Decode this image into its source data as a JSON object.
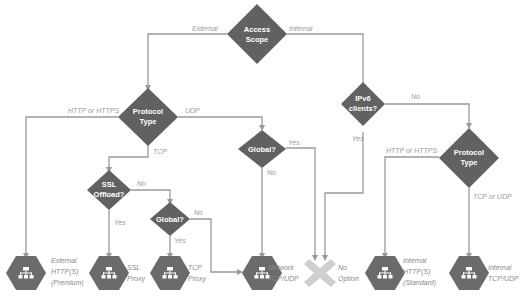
{
  "diagram": {
    "type": "decision-tree",
    "colors": {
      "decision_fill": "#616161",
      "leaf_fill": "#6b6b6b",
      "line": "#9a9a9a",
      "edge_label": "#9a9a9a",
      "no_option_fill": "#cfcfcf"
    },
    "decisions": {
      "access_scope": {
        "line1": "Access",
        "line2": "Scope"
      },
      "protocol_type_ext": {
        "line1": "Protocol",
        "line2": "Type"
      },
      "global_udp": {
        "line1": "Global?"
      },
      "ssl_offload": {
        "line1": "SSL",
        "line2": "Offload?"
      },
      "global_tcp": {
        "line1": "Global?"
      },
      "ipv6_clients": {
        "line1": "IPv6",
        "line2": "clients?"
      },
      "protocol_type_int": {
        "line1": "Protocol",
        "line2": "Type"
      }
    },
    "edges": {
      "external": "External",
      "internal": "Internal",
      "http_https_ext": "HTTP or HTTPS",
      "udp": "UDP",
      "tcp": "TCP",
      "global_udp_yes": "Yes",
      "global_udp_no": "No",
      "ssl_no": "No",
      "ssl_yes": "Yes",
      "global_tcp_no": "No",
      "global_tcp_yes": "Yes",
      "ipv6_yes": "Yes",
      "ipv6_no": "No",
      "http_https_int": "HTTP or HTTPS",
      "tcp_or_udp": "TCP or UDP"
    },
    "leaves": {
      "ext_https": {
        "line1": "External",
        "line2": "HTTP(S)",
        "line3": "(Premium)",
        "icon": "load-balancer-icon"
      },
      "ssl_proxy": {
        "line1": "SSL",
        "line2": "Proxy",
        "icon": "load-balancer-icon"
      },
      "tcp_proxy": {
        "line1": "TCP",
        "line2": "Proxy",
        "icon": "load-balancer-icon"
      },
      "network": {
        "line1": "Network",
        "line2": "TCP/UDP",
        "icon": "load-balancer-icon"
      },
      "no_option": {
        "line1": "No",
        "line2": "Option",
        "icon": "x-icon"
      },
      "int_https": {
        "line1": "Internal",
        "line2": "HTTP(S)",
        "line3": "(Standard)",
        "icon": "load-balancer-icon"
      },
      "int_tcpudp": {
        "line1": "Internal",
        "line2": "TCP/UDP",
        "icon": "load-balancer-icon"
      }
    }
  }
}
